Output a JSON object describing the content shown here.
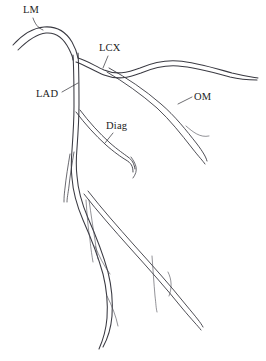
{
  "diagram": {
    "background_color": "#ffffff",
    "stroke_color": "#3a3a42",
    "label_color": "#1c1c1c",
    "width": 266,
    "height": 361,
    "labels": [
      {
        "id": "lm",
        "text": "LM",
        "name": "Left Main coronary artery"
      },
      {
        "id": "lcx",
        "text": "LCX",
        "name": "Left Circumflex artery"
      },
      {
        "id": "lad",
        "text": "LAD",
        "name": "Left Anterior Descending artery"
      },
      {
        "id": "diag",
        "text": "Diag",
        "name": "Diagonal branch"
      },
      {
        "id": "om",
        "text": "OM",
        "name": "Obtuse Marginal branch"
      }
    ],
    "vessels": [
      {
        "id": "lm",
        "label": "LM"
      },
      {
        "id": "lcx",
        "label": "LCX"
      },
      {
        "id": "lad",
        "label": "LAD"
      },
      {
        "id": "diag",
        "label": "Diag"
      },
      {
        "id": "om",
        "label": "OM"
      }
    ]
  }
}
